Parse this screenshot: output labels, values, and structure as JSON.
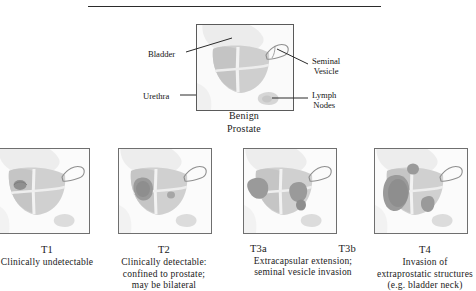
{
  "figure": {
    "type": "diagram",
    "divider": "horizontal-rule"
  },
  "hero": {
    "caption_line1": "Benign",
    "caption_line2": "Prostate",
    "labels": [
      {
        "id": "bladder",
        "text": "Bladder",
        "side": "left"
      },
      {
        "id": "urethra",
        "text": "Urethra",
        "side": "left"
      },
      {
        "id": "seminal",
        "line1": "Seminal",
        "line2": "Vesicle",
        "side": "right"
      },
      {
        "id": "lymph",
        "line1": "Lymph",
        "line2": "Nodes",
        "side": "right"
      }
    ]
  },
  "stages": [
    {
      "id": "t1",
      "stage": "T1",
      "stage_b": "",
      "desc_lines": [
        "Clinically undetectable"
      ]
    },
    {
      "id": "t2",
      "stage": "T2",
      "stage_b": "",
      "desc_lines": [
        "Clinically detectable:",
        "confined to prostate;",
        "may be bilateral"
      ]
    },
    {
      "id": "t3",
      "stage": "T3a",
      "stage_b": "T3b",
      "desc_lines": [
        "Extracapsular extension;",
        "seminal vesicle invasion"
      ]
    },
    {
      "id": "t4",
      "stage": "T4",
      "stage_b": "",
      "desc_lines": [
        "Invasion of",
        "extraprostatic structures",
        "(e.g. bladder neck)"
      ]
    }
  ],
  "colors": {
    "ink": "#1a1a1a",
    "frame": "#6f6f6f",
    "rule": "#2b2b2b",
    "tissue_light": "#e4e4e4",
    "tissue_mid": "#cfcfcf",
    "tissue_dark": "#bcbcbc",
    "tumor": "#9a9a9a",
    "tumor_dark": "#8a8a8a",
    "background": "#ffffff"
  }
}
